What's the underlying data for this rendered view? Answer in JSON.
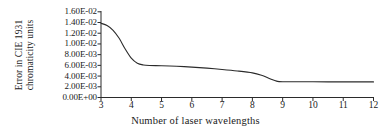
{
  "chart_data": {
    "type": "line",
    "title": "",
    "xlabel": "Number of laser wavelengths",
    "ylabel": "Error in CIE 1931 chromaticity units",
    "ylabel_lines": [
      "Error in CIE 1931",
      "chromaticity units"
    ],
    "xlim": [
      3,
      12
    ],
    "ylim": [
      0.0,
      0.016
    ],
    "grid": false,
    "legend": null,
    "x_ticks": [
      3,
      4,
      5,
      6,
      7,
      8,
      9,
      10,
      11,
      12
    ],
    "x_tick_labels": [
      "3",
      "4",
      "5",
      "6",
      "7",
      "8",
      "9",
      "10",
      "11",
      "12"
    ],
    "y_ticks": [
      0.0,
      0.002,
      0.004,
      0.006,
      0.008,
      0.01,
      0.012,
      0.014,
      0.016
    ],
    "y_tick_labels": [
      "0.00E+00",
      "2.00E-03",
      "4.00E-03",
      "6.00E-03",
      "8.00E-03",
      "1.00E-02",
      "1.20E-02",
      "1.40E-02",
      "1.60E-02"
    ],
    "series": [
      {
        "name": "Error in CIE 1931 chromaticity units",
        "color": "#2b2b2b",
        "line_width": 1.1,
        "x": [
          3.0,
          3.2,
          3.4,
          3.6,
          3.8,
          4.0,
          4.2,
          4.4,
          4.6,
          5.0,
          5.5,
          6.0,
          6.5,
          7.0,
          7.5,
          8.0,
          8.3,
          8.6,
          8.8,
          9.0,
          10.0,
          11.0,
          12.0
        ],
        "values": [
          0.01385,
          0.01345,
          0.01255,
          0.01105,
          0.00905,
          0.00735,
          0.0064,
          0.00608,
          0.00598,
          0.00593,
          0.00583,
          0.00568,
          0.00548,
          0.00523,
          0.00495,
          0.0046,
          0.00415,
          0.00345,
          0.00305,
          0.00295,
          0.00293,
          0.00292,
          0.00291
        ]
      }
    ]
  },
  "axes": {
    "axis_color": "#2b2b2b",
    "tick_color": "#2b2b2b",
    "background": "#ffffff"
  }
}
